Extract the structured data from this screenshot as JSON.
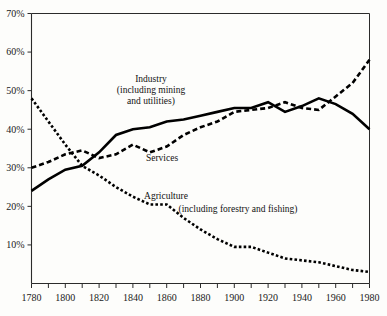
{
  "chart_data": {
    "type": "line",
    "title": "",
    "subtitle": "",
    "xlabel": "",
    "ylabel": "",
    "xlim": [
      1780,
      1980
    ],
    "ylim": [
      0,
      70
    ],
    "grid": false,
    "legend_position": "inline-annotations",
    "x_tick_labels": [
      "1780",
      "1800",
      "1820",
      "1840",
      "1860",
      "1880",
      "1900",
      "1920",
      "1940",
      "1960",
      "1980"
    ],
    "x_tick_values": [
      1780,
      1800,
      1820,
      1840,
      1860,
      1880,
      1900,
      1920,
      1940,
      1960,
      1980
    ],
    "x_minor_tick_values": [
      1790,
      1810,
      1830,
      1850,
      1870,
      1890,
      1910,
      1930,
      1950,
      1970
    ],
    "y_tick_labels": [
      "10%",
      "20%",
      "30%",
      "40%",
      "50%",
      "60%",
      "70%"
    ],
    "y_tick_values": [
      10,
      20,
      30,
      40,
      50,
      60,
      70
    ],
    "series": [
      {
        "name": "Agriculture",
        "style": "dotted",
        "x": [
          1780,
          1790,
          1800,
          1810,
          1820,
          1830,
          1840,
          1850,
          1860,
          1870,
          1880,
          1890,
          1900,
          1910,
          1920,
          1930,
          1940,
          1950,
          1960,
          1970,
          1980
        ],
        "values": [
          48.0,
          42.0,
          36.0,
          30.5,
          28.0,
          25.0,
          22.5,
          20.5,
          20.5,
          17.0,
          14.0,
          11.5,
          9.5,
          9.5,
          8.0,
          6.5,
          6.0,
          5.5,
          4.5,
          3.5,
          3.0
        ]
      },
      {
        "name": "Industry",
        "style": "solid",
        "x": [
          1780,
          1790,
          1800,
          1810,
          1820,
          1830,
          1840,
          1850,
          1860,
          1870,
          1880,
          1890,
          1900,
          1910,
          1920,
          1930,
          1940,
          1950,
          1960,
          1970,
          1980
        ],
        "values": [
          24.0,
          27.0,
          29.5,
          30.5,
          34.0,
          38.5,
          40.0,
          40.5,
          42.0,
          42.5,
          43.5,
          44.5,
          45.5,
          45.5,
          47.0,
          44.5,
          46.0,
          48.0,
          46.5,
          44.0,
          40.0
        ]
      },
      {
        "name": "Services",
        "style": "dashed",
        "x": [
          1780,
          1790,
          1800,
          1810,
          1820,
          1830,
          1840,
          1850,
          1860,
          1870,
          1880,
          1890,
          1900,
          1910,
          1920,
          1930,
          1940,
          1950,
          1960,
          1970,
          1980
        ],
        "values": [
          30.0,
          31.5,
          33.5,
          34.5,
          32.5,
          33.5,
          36.0,
          34.0,
          35.5,
          38.5,
          40.5,
          42.0,
          44.5,
          45.0,
          45.5,
          47.0,
          45.5,
          45.0,
          48.5,
          52.0,
          58.0
        ]
      }
    ],
    "annotations": [
      {
        "name": "industry-label",
        "lines": [
          "Industry",
          "(including mining",
          "and utilities)"
        ],
        "x": 151,
        "y": 82
      },
      {
        "name": "services-label",
        "lines": [
          "Services"
        ],
        "x": 162,
        "y": 161
      },
      {
        "name": "agriculture-label",
        "lines": [
          "Agriculture"
        ],
        "x": 166,
        "y": 199
      },
      {
        "name": "agriculture-sublabel",
        "lines": [
          "(including forestry and fishing)"
        ],
        "x": 238,
        "y": 212
      }
    ],
    "colors": {
      "line": "#000000",
      "axis": "#2b2b2b",
      "background": "#fdfdfb",
      "text": "#111111"
    }
  }
}
